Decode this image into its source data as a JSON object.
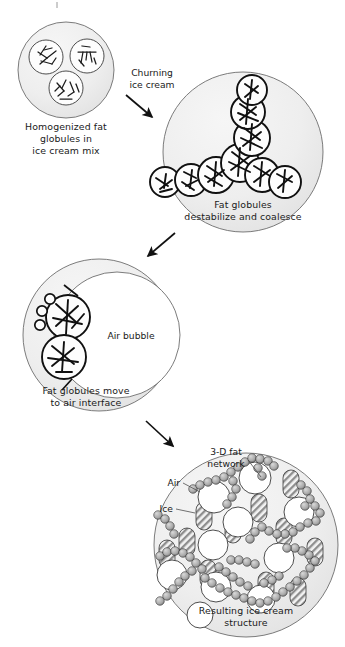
{
  "figure": {
    "background_color": "#ffffff",
    "matrix_fill": "#eeeeee",
    "outline_color": "#6d6d6d",
    "text_color": "#1a1a1a"
  },
  "panels": [
    {
      "id": "panel-1",
      "caption_lines": [
        "Homogenized fat",
        "globules in",
        "ice cream mix"
      ],
      "contents": "three separate fat globules containing fat crystals, dispersed in ice cream mix"
    },
    {
      "id": "panel-2",
      "caption_lines": [
        "Fat globules",
        "destabilize and coalesce"
      ],
      "contents": "branched chain of coalesced fat globules packed with fat crystals"
    },
    {
      "id": "panel-3",
      "caption_lines": [
        "Fat globules move",
        "to air interface"
      ],
      "internal_label": "Air bubble",
      "contents": "two fat globules adsorbed at the surface of an air bubble"
    },
    {
      "id": "panel-4",
      "caption_lines": [
        "Resulting ice cream",
        "structure"
      ],
      "internal_labels": [
        {
          "name": "fat-network-label",
          "lines": [
            "3-D fat",
            "network"
          ]
        },
        {
          "name": "air-label",
          "lines": [
            "Air"
          ]
        },
        {
          "name": "ice-label",
          "lines": [
            "Ice"
          ]
        }
      ],
      "contents": "air bubbles, ice crystals and a three-dimensional partially coalesced fat network"
    }
  ],
  "arrows": [
    {
      "id": "arrow-1",
      "label_lines": [
        "Churning",
        "ice cream"
      ],
      "from": "panel-1",
      "to": "panel-2"
    },
    {
      "id": "arrow-2",
      "label_lines": [],
      "from": "panel-2",
      "to": "panel-3"
    },
    {
      "id": "arrow-3",
      "label_lines": [],
      "from": "panel-3",
      "to": "panel-4"
    }
  ]
}
